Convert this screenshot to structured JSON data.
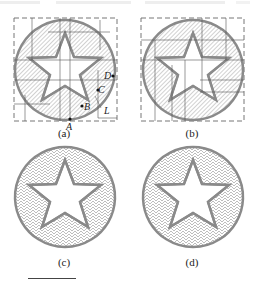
{
  "header": {
    "faded_text": "........  ................  ......................  ..  ."
  },
  "figure": {
    "panels": [
      {
        "id": "a",
        "caption": "(a)",
        "fill": "parallel-hatch-with-partition",
        "points": [
          "A",
          "B",
          "C",
          "D"
        ],
        "line_label": "L"
      },
      {
        "id": "b",
        "caption": "(b)",
        "fill": "parallel-hatch-with-partition"
      },
      {
        "id": "c",
        "caption": "(c)",
        "fill": "zigzag-contour"
      },
      {
        "id": "d",
        "caption": "(d)",
        "fill": "zigzag-contour"
      }
    ],
    "labels": {
      "A": "A",
      "B": "B",
      "C": "C",
      "D": "D",
      "L": "L"
    },
    "colors": {
      "outline": "#8a8a8a",
      "hatch": "#9a9a9a",
      "dash": "#777777",
      "grid": "#555555"
    }
  }
}
